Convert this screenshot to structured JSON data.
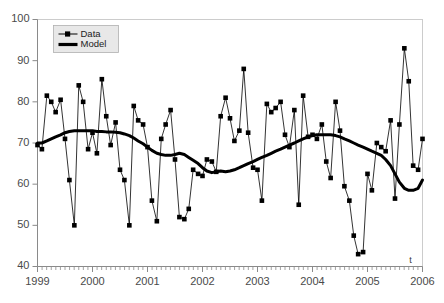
{
  "chart_data": {
    "type": "line",
    "title": "",
    "subtitle": "",
    "xlabel": "t",
    "ylabel": "",
    "xlim": [
      1999,
      2006
    ],
    "ylim": [
      40,
      100
    ],
    "yticks": [
      40,
      50,
      60,
      70,
      80,
      90,
      100
    ],
    "xticks": [
      1999,
      2000,
      2001,
      2002,
      2003,
      2004,
      2005,
      2006
    ],
    "xtick_labels": [
      "1999",
      "2000",
      "2001",
      "2002",
      "2003",
      "2004",
      "2005",
      "2006"
    ],
    "ytick_labels": [
      "40",
      "50",
      "60",
      "70",
      "80",
      "90",
      "100"
    ],
    "minor_xticks_per_major": 12,
    "grid": false,
    "legend_position": "top-left-inside",
    "x": [
      1999.0,
      1999.08,
      1999.17,
      1999.25,
      1999.33,
      1999.42,
      1999.5,
      1999.58,
      1999.67,
      1999.75,
      1999.83,
      1999.92,
      2000.0,
      2000.08,
      2000.17,
      2000.25,
      2000.33,
      2000.42,
      2000.5,
      2000.58,
      2000.67,
      2000.75,
      2000.83,
      2000.92,
      2001.0,
      2001.08,
      2001.17,
      2001.25,
      2001.33,
      2001.42,
      2001.5,
      2001.58,
      2001.67,
      2001.75,
      2001.83,
      2001.92,
      2002.0,
      2002.08,
      2002.17,
      2002.25,
      2002.33,
      2002.42,
      2002.5,
      2002.58,
      2002.67,
      2002.75,
      2002.83,
      2002.92,
      2003.0,
      2003.08,
      2003.17,
      2003.25,
      2003.33,
      2003.42,
      2003.5,
      2003.58,
      2003.67,
      2003.75,
      2003.83,
      2003.92,
      2004.0,
      2004.08,
      2004.17,
      2004.25,
      2004.33,
      2004.42,
      2004.5,
      2004.58,
      2004.67,
      2004.75,
      2004.83,
      2004.92,
      2005.0,
      2005.08,
      2005.17,
      2005.25,
      2005.33,
      2005.42,
      2005.5,
      2005.58,
      2005.67,
      2005.75,
      2005.83,
      2005.92,
      2006.0
    ],
    "series": [
      {
        "name": "Data",
        "marker": "square",
        "linewidth": 0.8,
        "color": "#000000",
        "values": [
          69.5,
          68.5,
          81.5,
          80.0,
          77.5,
          80.5,
          71.0,
          61.0,
          50.0,
          84.0,
          80.0,
          68.5,
          72.5,
          67.5,
          85.5,
          76.5,
          69.5,
          75.0,
          63.5,
          61.0,
          50.0,
          79.0,
          75.5,
          74.5,
          69.0,
          56.0,
          51.0,
          71.0,
          74.5,
          78.0,
          66.0,
          52.0,
          51.5,
          54.0,
          63.5,
          62.5,
          62.0,
          66.0,
          65.5,
          63.0,
          76.5,
          81.0,
          76.0,
          70.5,
          73.0,
          88.0,
          72.5,
          64.0,
          63.5,
          56.0,
          79.5,
          77.5,
          78.5,
          80.0,
          72.0,
          69.0,
          78.0,
          55.0,
          81.5,
          71.5,
          72.0,
          71.0,
          74.5,
          65.5,
          61.5,
          80.0,
          73.0,
          59.5,
          56.0,
          47.5,
          43.0,
          43.5,
          62.5,
          58.5,
          70.0,
          69.0,
          68.0,
          75.5,
          56.5,
          74.5,
          93.0,
          85.0,
          64.5,
          63.5,
          71.0
        ]
      },
      {
        "name": "Model",
        "marker": "none",
        "linewidth": 3.0,
        "color": "#000000",
        "values": [
          70.0,
          70.0,
          70.5,
          71.0,
          71.5,
          72.0,
          72.5,
          72.8,
          73.0,
          73.0,
          73.0,
          73.0,
          73.0,
          72.8,
          72.8,
          72.7,
          72.7,
          72.6,
          72.5,
          72.2,
          71.8,
          71.2,
          70.5,
          69.8,
          69.0,
          68.2,
          67.5,
          67.2,
          67.0,
          67.0,
          67.2,
          67.5,
          67.2,
          66.5,
          65.8,
          65.0,
          64.0,
          63.2,
          62.8,
          63.0,
          63.2,
          63.0,
          63.2,
          63.5,
          64.0,
          64.5,
          65.0,
          65.5,
          66.0,
          66.5,
          67.0,
          67.5,
          68.0,
          68.5,
          69.0,
          69.5,
          70.0,
          70.5,
          71.0,
          71.5,
          71.8,
          72.0,
          72.0,
          72.0,
          72.0,
          71.8,
          71.5,
          71.0,
          70.5,
          70.0,
          69.5,
          69.0,
          68.5,
          68.0,
          67.5,
          67.0,
          66.0,
          64.5,
          62.5,
          60.5,
          59.0,
          58.5,
          58.5,
          59.0,
          61.0
        ],
        "values_tail": [
          63.5,
          63.5,
          64.0,
          64.5,
          66.0,
          68.0,
          71.0
        ]
      }
    ],
    "legend": [
      {
        "label": "Data",
        "marker": "line-square"
      },
      {
        "label": "Model",
        "marker": "thick-line"
      }
    ],
    "colors": {
      "axis": "#8a8a8a",
      "plot_border": "#cccccc",
      "tick_label": "#4a4a4a",
      "series": "#000000",
      "legend_background": "#e8e8e8",
      "legend_border": "#b0b0b0"
    }
  }
}
